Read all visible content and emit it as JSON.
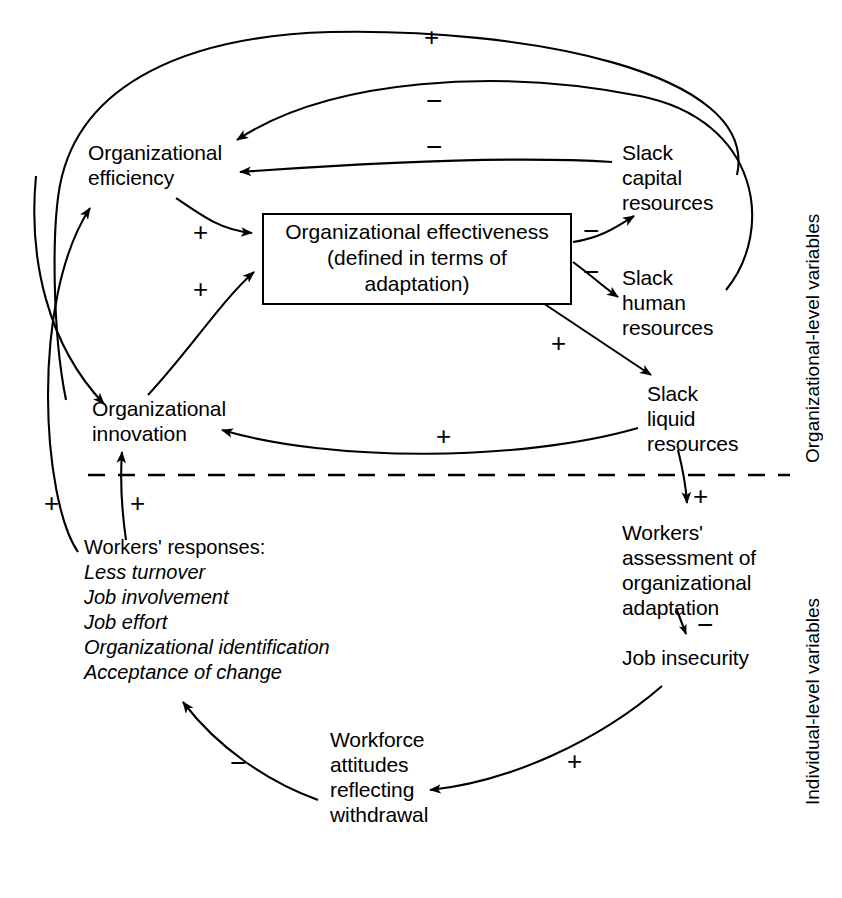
{
  "diagram": {
    "nodes": {
      "org_efficiency": "Organizational\nefficiency",
      "org_effectiveness": "Organizational effectiveness\n(defined in terms of  adaptation)",
      "slack_capital": "Slack\ncapital\nresources",
      "slack_human": "Slack\nhuman\nresources",
      "slack_liquid": "Slack\nliquid\nresources",
      "org_innovation": "Organizational\ninnovation",
      "workers_assessment": "Workers'\nassessment of\norganizational\nadaptation",
      "job_insecurity": "Job insecurity",
      "workforce_attitudes": "Workforce\nattitudes\nreflecting\nwithdrawal"
    },
    "workers_responses": {
      "title": "Workers' responses:",
      "items": [
        "Less turnover",
        "Job involvement",
        "Job effort",
        "Organizational identification",
        "Acceptance of change"
      ]
    },
    "level_labels": {
      "organizational": "Organizational-level variables",
      "individual": "Individual-level variables"
    },
    "signs": {
      "top_outer_plus": "+",
      "top_inner_minus": "−",
      "efficiency_inner_minus": "−",
      "efficiency_to_effectiveness_plus": "+",
      "innovation_to_effectiveness_plus": "+",
      "effectiveness_to_capital_minus": "−",
      "effectiveness_to_human_minus": "−",
      "effectiveness_to_liquid_plus": "+",
      "liquid_to_innovation_plus": "+",
      "responses_to_efficiency_plus": "+",
      "responses_to_innovation_plus": "+",
      "liquid_to_assessment_plus": "+",
      "assessment_to_insecurity_minus": "−",
      "insecurity_to_attitudes_plus": "+",
      "attitudes_to_responses_minus": "−"
    },
    "colors": {
      "ink": "#000000",
      "background": "#ffffff"
    }
  }
}
